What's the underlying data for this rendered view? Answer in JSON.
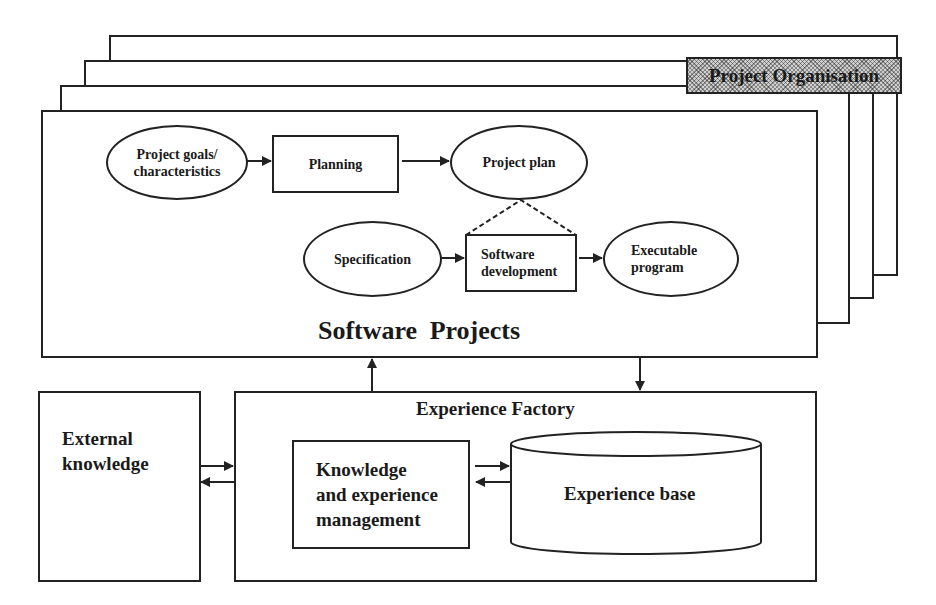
{
  "diagram": {
    "project_organisation": {
      "label": "Project Organisation",
      "stacked_frames": 4
    },
    "software_projects": {
      "title": "Software Projects",
      "nodes": [
        {
          "id": "goals",
          "shape": "ellipse",
          "label_lines": [
            "Project goals/",
            "characteristics"
          ]
        },
        {
          "id": "planning",
          "shape": "rect",
          "label": "Planning"
        },
        {
          "id": "plan",
          "shape": "ellipse",
          "label": "Project plan"
        },
        {
          "id": "spec",
          "shape": "ellipse",
          "label": "Specification"
        },
        {
          "id": "swdev",
          "shape": "rect",
          "label_lines": [
            "Software",
            "development"
          ]
        },
        {
          "id": "exec",
          "shape": "ellipse",
          "label_lines": [
            "Executable",
            "program"
          ]
        }
      ],
      "edges": [
        {
          "from": "goals",
          "to": "planning",
          "style": "arrow"
        },
        {
          "from": "planning",
          "to": "plan",
          "style": "arrow"
        },
        {
          "from": "spec",
          "to": "swdev",
          "style": "arrow"
        },
        {
          "from": "swdev",
          "to": "exec",
          "style": "arrow"
        },
        {
          "from": "plan",
          "to": "swdev",
          "style": "dashed-bracket"
        }
      ]
    },
    "experience_factory": {
      "title": "Experience Factory",
      "management": {
        "label_lines": [
          "Knowledge",
          "and experience",
          "management"
        ]
      },
      "base": {
        "shape": "cylinder",
        "label": "Experience base"
      }
    },
    "external_knowledge": {
      "label_lines": [
        "External",
        "knowledge"
      ]
    },
    "connections": [
      {
        "from": "experience_factory",
        "to": "software_projects",
        "style": "arrow-up"
      },
      {
        "from": "software_projects",
        "to": "experience_factory",
        "style": "arrow-down"
      },
      {
        "from": "external_knowledge",
        "to": "experience_factory",
        "style": "bidirectional"
      },
      {
        "from": "management",
        "to": "base",
        "style": "bidirectional"
      }
    ]
  }
}
